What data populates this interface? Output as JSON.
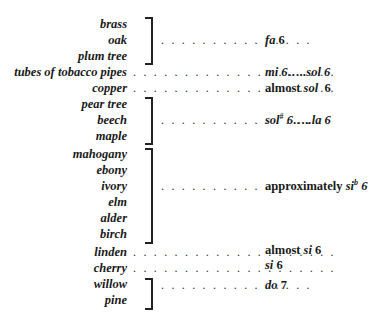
{
  "table": {
    "rows": [
      {
        "labels": [
          "brass",
          "oak",
          "plum tree"
        ],
        "value_prefix": "",
        "value": "fa 6"
      },
      {
        "labels": [
          "tubes of tobacco pipes"
        ],
        "value_prefix": "",
        "value": "mi 6…..sol 6"
      },
      {
        "labels": [
          "copper"
        ],
        "value_prefix": "almost",
        "value": "sol 6"
      },
      {
        "labels": [
          "pear tree",
          "beech",
          "maple"
        ],
        "value_prefix": "",
        "value": "sol# 6…..la 6"
      },
      {
        "labels": [
          "mahogany",
          "ebony",
          "ivory",
          "elm",
          "alder",
          "birch"
        ],
        "value_prefix": "approximately",
        "value": "si♭ 6"
      },
      {
        "labels": [
          "linden"
        ],
        "value_prefix": "almost",
        "value": "si 6"
      },
      {
        "labels": [
          "cherry"
        ],
        "value_prefix": "",
        "value": "si 6"
      },
      {
        "labels": [
          "willow",
          "pine"
        ],
        "value_prefix": "",
        "value": "do 7"
      }
    ],
    "l": {
      "brass": "brass",
      "oak": "oak",
      "plum": "plum tree",
      "tubes": "tubes of tobacco pipes",
      "copper": "copper",
      "pear": "pear tree",
      "beech": "beech",
      "maple": "maple",
      "mahogany": "mahogany",
      "ebony": "ebony",
      "ivory": "ivory",
      "elm": "elm",
      "alder": "alder",
      "birch": "birch",
      "linden": "linden",
      "cherry": "cherry",
      "willow": "willow",
      "pine": "pine"
    },
    "v": {
      "fa": "fa",
      "n6": "6",
      "mi": "mi 6…..sol 6",
      "almost": "almost",
      "sol": "sol",
      "solsharp": "sol",
      "sharp": "#",
      "la": " 6…..la 6",
      "approx": "approximately",
      "si": "si",
      "flat": "b",
      "si6": " 6",
      "do": "do",
      "n7": "7"
    },
    "dots_long": ". . . . . . . . . . . . . . . . . . . .",
    "dots_bracket": ". . . . . . . . . . . . . . ."
  }
}
